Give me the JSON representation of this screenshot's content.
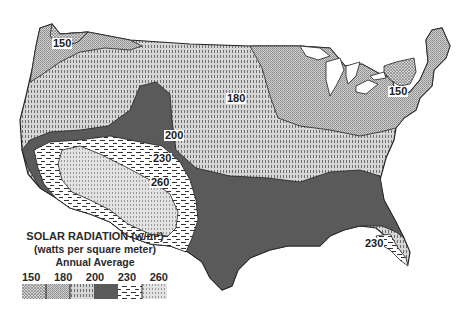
{
  "map": {
    "title": "SOLAR RADIATION (w/m²)",
    "subtitle": "(watts per square meter)",
    "period": "Annual Average",
    "region": "Contiguous United States",
    "contour_labels": [
      {
        "value": "150",
        "location": "Pacific Northwest"
      },
      {
        "value": "150",
        "location": "Northeast / New England"
      },
      {
        "value": "180",
        "location": "Upper Midwest"
      },
      {
        "value": "200",
        "location": "Central Rockies"
      },
      {
        "value": "230",
        "location": "Southwest"
      },
      {
        "value": "260",
        "location": "Desert Southwest"
      },
      {
        "value": "230",
        "location": "South Florida"
      }
    ]
  },
  "legend": {
    "title": "SOLAR RADIATION (w/m²)",
    "subtitle": "(watts per square meter)",
    "period": "Annual Average",
    "ticks": [
      "150",
      "180",
      "200",
      "230",
      "260"
    ],
    "classes": [
      {
        "range": "<150",
        "pattern": "fine-dots",
        "color": "#bdbdbd"
      },
      {
        "range": "150-180",
        "pattern": "crosshatch",
        "color": "#c9c9c9"
      },
      {
        "range": "180-200",
        "pattern": "vertical-dashes",
        "color": "#d2d2d2"
      },
      {
        "range": "200-230",
        "pattern": "solid-dark",
        "color": "#5a5a5a"
      },
      {
        "range": "230-260",
        "pattern": "horizontal-dashes",
        "color": "#ffffff"
      },
      {
        "range": ">260",
        "pattern": "light-vertical-dashes",
        "color": "#dedede"
      }
    ]
  },
  "labels": {
    "nw150": "150",
    "ne150": "150",
    "mw180": "180",
    "r200": "200",
    "sw230": "230",
    "sw260": "260",
    "fl230": "230"
  }
}
